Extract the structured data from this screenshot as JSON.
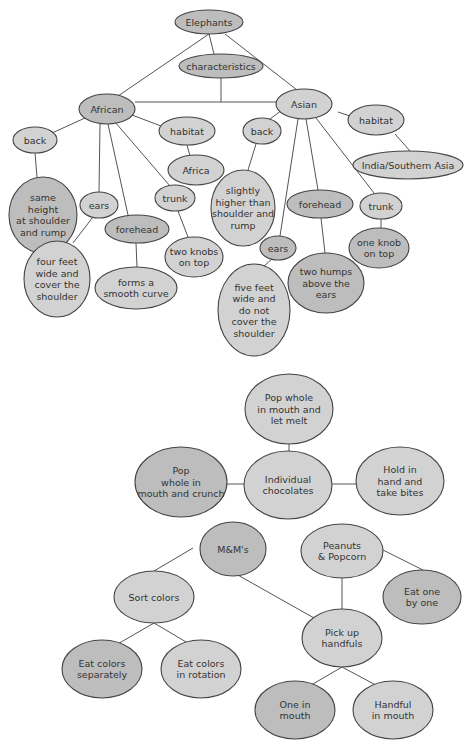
{
  "diagrams": [
    {
      "title": "Elephants concept map",
      "nodes": [
        {
          "id": "elephants",
          "label": [
            "Elephants"
          ],
          "cx": 209,
          "cy": 22,
          "rx": 34,
          "ry": 12,
          "shade": "dark"
        },
        {
          "id": "characteristics",
          "label": [
            "characteristics"
          ],
          "cx": 221,
          "cy": 66,
          "rx": 42,
          "ry": 12,
          "shade": "dark"
        },
        {
          "id": "african",
          "label": [
            "African"
          ],
          "cx": 107,
          "cy": 109,
          "rx": 28,
          "ry": 15,
          "shade": "dark"
        },
        {
          "id": "asian",
          "label": [
            "Asian"
          ],
          "cx": 304,
          "cy": 104,
          "rx": 28,
          "ry": 15,
          "shade": "light"
        },
        {
          "id": "habitat-african",
          "label": [
            "habitat"
          ],
          "cx": 187,
          "cy": 131,
          "rx": 28,
          "ry": 14,
          "shade": "light"
        },
        {
          "id": "africa",
          "label": [
            "Africa"
          ],
          "cx": 196,
          "cy": 170,
          "rx": 28,
          "ry": 15,
          "shade": "light"
        },
        {
          "id": "habitat-asian",
          "label": [
            "habitat"
          ],
          "cx": 376,
          "cy": 120,
          "rx": 28,
          "ry": 15,
          "shade": "light"
        },
        {
          "id": "india",
          "label": [
            "India/Southern Asia"
          ],
          "cx": 408,
          "cy": 165,
          "rx": 55,
          "ry": 14,
          "shade": "light"
        },
        {
          "id": "back-african",
          "label": [
            "back"
          ],
          "cx": 35,
          "cy": 140,
          "rx": 22,
          "ry": 13,
          "shade": "light"
        },
        {
          "id": "same-height",
          "label": [
            "same",
            "height",
            "at shoulder",
            "and rump"
          ],
          "cx": 43,
          "cy": 215,
          "rx": 34,
          "ry": 38,
          "shade": "dark"
        },
        {
          "id": "back-asian",
          "label": [
            "back"
          ],
          "cx": 262,
          "cy": 131,
          "rx": 19,
          "ry": 13,
          "shade": "light"
        },
        {
          "id": "slightly-higher",
          "label": [
            "slightly",
            "higher than",
            "shoulder and",
            "rump"
          ],
          "cx": 243,
          "cy": 208,
          "rx": 32,
          "ry": 38,
          "shade": "light"
        },
        {
          "id": "ears-african",
          "label": [
            "ears"
          ],
          "cx": 99,
          "cy": 205,
          "rx": 19,
          "ry": 13,
          "shade": "light"
        },
        {
          "id": "four-feet",
          "label": [
            "four feet",
            "wide and",
            "cover the",
            "shoulder"
          ],
          "cx": 57,
          "cy": 279,
          "rx": 33,
          "ry": 38,
          "shade": "light"
        },
        {
          "id": "forehead-african",
          "label": [
            "forehead"
          ],
          "cx": 137,
          "cy": 229,
          "rx": 32,
          "ry": 14,
          "shade": "dark"
        },
        {
          "id": "smooth-curve",
          "label": [
            "forms a",
            "smooth curve"
          ],
          "cx": 136,
          "cy": 288,
          "rx": 41,
          "ry": 21,
          "shade": "light"
        },
        {
          "id": "trunk-african",
          "label": [
            "trunk"
          ],
          "cx": 175,
          "cy": 198,
          "rx": 20,
          "ry": 13,
          "shade": "light"
        },
        {
          "id": "two-knobs",
          "label": [
            "two knobs",
            "on top"
          ],
          "cx": 194,
          "cy": 257,
          "rx": 29,
          "ry": 20,
          "shade": "light"
        },
        {
          "id": "ears-asian",
          "label": [
            "ears"
          ],
          "cx": 278,
          "cy": 248,
          "rx": 18,
          "ry": 12,
          "shade": "dark"
        },
        {
          "id": "five-feet",
          "label": [
            "five feet",
            "wide and",
            "do not",
            "cover the",
            "shoulder"
          ],
          "cx": 254,
          "cy": 310,
          "rx": 36,
          "ry": 46,
          "shade": "light"
        },
        {
          "id": "forehead-asian",
          "label": [
            "forehead"
          ],
          "cx": 320,
          "cy": 204,
          "rx": 33,
          "ry": 14,
          "shade": "dark"
        },
        {
          "id": "two-humps",
          "label": [
            "two humps",
            "above the",
            "ears"
          ],
          "cx": 326,
          "cy": 283,
          "rx": 38,
          "ry": 30,
          "shade": "dark"
        },
        {
          "id": "trunk-asian",
          "label": [
            "trunk"
          ],
          "cx": 381,
          "cy": 206,
          "rx": 21,
          "ry": 13,
          "shade": "light"
        },
        {
          "id": "one-knob",
          "label": [
            "one knob",
            "on top"
          ],
          "cx": 379,
          "cy": 248,
          "rx": 30,
          "ry": 20,
          "shade": "dark"
        }
      ],
      "edges": [
        [
          209,
          34,
          118,
          96
        ],
        [
          209,
          34,
          214,
          54
        ],
        [
          225,
          34,
          297,
          90
        ],
        [
          221,
          78,
          221,
          102
        ],
        [
          135,
          102,
          276,
          102
        ],
        [
          85,
          118,
          52,
          133
        ],
        [
          132,
          115,
          161,
          126
        ],
        [
          187,
          145,
          190,
          156
        ],
        [
          35,
          153,
          37,
          177
        ],
        [
          100,
          124,
          99,
          192
        ],
        [
          108,
          124,
          128,
          215
        ],
        [
          115,
          122,
          170,
          186
        ],
        [
          93,
          217,
          73,
          243
        ],
        [
          136,
          243,
          137,
          267
        ],
        [
          178,
          211,
          188,
          237
        ],
        [
          338,
          112,
          350,
          116
        ],
        [
          395,
          134,
          410,
          151
        ],
        [
          282,
          110,
          270,
          119
        ],
        [
          256,
          144,
          248,
          170
        ],
        [
          298,
          119,
          280,
          236
        ],
        [
          306,
          119,
          318,
          190
        ],
        [
          316,
          118,
          374,
          193
        ],
        [
          272,
          259,
          264,
          266
        ],
        [
          321,
          218,
          325,
          253
        ],
        [
          381,
          219,
          381,
          228
        ]
      ]
    },
    {
      "title": "Individual chocolates web",
      "nodes": [
        {
          "id": "let-melt",
          "label": [
            "Pop whole",
            "in mouth and",
            "let melt"
          ],
          "cx": 289,
          "cy": 409,
          "rx": 44,
          "ry": 35,
          "shade": "light"
        },
        {
          "id": "individual-chocolates",
          "label": [
            "Individual",
            "chocolates"
          ],
          "cx": 288,
          "cy": 485,
          "rx": 44,
          "ry": 34,
          "shade": "light"
        },
        {
          "id": "crunch",
          "label": [
            "Pop",
            "whole in",
            "mouth and crunch"
          ],
          "cx": 181,
          "cy": 482,
          "rx": 46,
          "ry": 35,
          "shade": "dark"
        },
        {
          "id": "take-bites",
          "label": [
            "Hold in",
            "hand and",
            "take bites"
          ],
          "cx": 400,
          "cy": 481,
          "rx": 44,
          "ry": 34,
          "shade": "light"
        }
      ],
      "edges": [
        [
          289,
          444,
          289,
          451
        ],
        [
          227,
          484,
          244,
          484
        ],
        [
          332,
          484,
          356,
          484
        ]
      ]
    },
    {
      "title": "M&M's / Peanuts & Popcorn tree",
      "nodes": [
        {
          "id": "mms",
          "label": [
            "M&M's"
          ],
          "cx": 233,
          "cy": 549,
          "rx": 33,
          "ry": 27,
          "shade": "dark"
        },
        {
          "id": "peanuts-popcorn",
          "label": [
            "Peanuts",
            "& Popcorn"
          ],
          "cx": 342,
          "cy": 551,
          "rx": 41,
          "ry": 27,
          "shade": "light"
        },
        {
          "id": "sort-colors",
          "label": [
            "Sort colors"
          ],
          "cx": 154,
          "cy": 597,
          "rx": 40,
          "ry": 26,
          "shade": "light"
        },
        {
          "id": "eat-one-by-one",
          "label": [
            "Eat one",
            "by one"
          ],
          "cx": 422,
          "cy": 597,
          "rx": 39,
          "ry": 27,
          "shade": "dark"
        },
        {
          "id": "pick-up-handfuls",
          "label": [
            "Pick up",
            "handfuls"
          ],
          "cx": 342,
          "cy": 638,
          "rx": 40,
          "ry": 29,
          "shade": "light"
        },
        {
          "id": "eat-separately",
          "label": [
            "Eat colors",
            "separately"
          ],
          "cx": 102,
          "cy": 669,
          "rx": 40,
          "ry": 29,
          "shade": "dark"
        },
        {
          "id": "eat-rotation",
          "label": [
            "Eat colors",
            "in rotation"
          ],
          "cx": 201,
          "cy": 669,
          "rx": 40,
          "ry": 29,
          "shade": "light"
        },
        {
          "id": "one-in-mouth",
          "label": [
            "One in",
            "mouth"
          ],
          "cx": 295,
          "cy": 710,
          "rx": 40,
          "ry": 29,
          "shade": "dark"
        },
        {
          "id": "handful-in-mouth",
          "label": [
            "Handful",
            "in mouth"
          ],
          "cx": 393,
          "cy": 710,
          "rx": 40,
          "ry": 29,
          "shade": "light"
        }
      ],
      "edges": [
        [
          193,
          548,
          154,
          571
        ],
        [
          236,
          574,
          314,
          618
        ],
        [
          342,
          578,
          342,
          609
        ],
        [
          383,
          550,
          423,
          570
        ],
        [
          154,
          623,
          109,
          649
        ],
        [
          154,
          623,
          198,
          649
        ],
        [
          342,
          667,
          301,
          691
        ],
        [
          342,
          667,
          387,
          691
        ]
      ]
    }
  ]
}
